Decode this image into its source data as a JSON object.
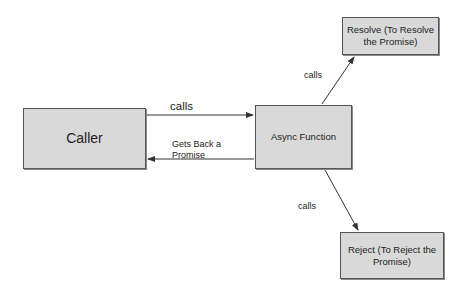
{
  "diagram": {
    "type": "flow",
    "nodes": [
      {
        "id": "caller",
        "label": "Caller"
      },
      {
        "id": "async",
        "label": "Async Function"
      },
      {
        "id": "resolve",
        "label": "Resolve (To Resolve the Promise)"
      },
      {
        "id": "reject",
        "label": "Reject (To Reject the Promise)"
      }
    ],
    "edges": [
      {
        "from": "caller",
        "to": "async",
        "label": "calls"
      },
      {
        "from": "async",
        "to": "caller",
        "label": "Gets Back a\nPromise"
      },
      {
        "from": "async",
        "to": "resolve",
        "label": "calls"
      },
      {
        "from": "async",
        "to": "reject",
        "label": "calls"
      }
    ],
    "colors": {
      "node_fill": "#d9d9d9",
      "node_border": "#555555",
      "edge": "#333333",
      "background": "#ffffff"
    }
  }
}
